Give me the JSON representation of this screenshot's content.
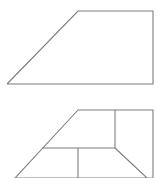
{
  "canvas": {
    "width": 158,
    "height": 178,
    "background_color": "#ffffff",
    "stroke_color": "#7d7d7d",
    "stroke_width": 1.1
  },
  "figures": [
    {
      "id": "figure-top",
      "name": "right-trapezoid",
      "description": "Right trapezoid with slanted left side, horizontal top and bottom, vertical right side",
      "outline_points": "7,84 78,11 153,11 153,84 7,84",
      "vertices": [
        {
          "name": "bottom-left-vertex",
          "x": 7,
          "y": 84
        },
        {
          "name": "top-left-vertex",
          "x": 78,
          "y": 11
        },
        {
          "name": "top-right-vertex",
          "x": 153,
          "y": 11
        },
        {
          "name": "bottom-right-vertex",
          "x": 153,
          "y": 84
        }
      ],
      "edges": [
        {
          "name": "left-slant-edge",
          "from": "7,84",
          "to": "78,11"
        },
        {
          "name": "top-edge",
          "from": "78,11",
          "to": "153,11"
        },
        {
          "name": "right-vertical-edge",
          "from": "153,11",
          "to": "153,84"
        },
        {
          "name": "bottom-edge",
          "from": "153,84",
          "to": "7,84"
        }
      ],
      "interior_segments": []
    },
    {
      "id": "figure-bottom",
      "name": "subdivided-trapezoid",
      "description": "Trapezoid cropped by image bottom edge, subdivided by interior horizontal and vertical segments",
      "outline_points": "78,110 153,110 153,178 15,178 78,110",
      "vertices": [
        {
          "name": "top-left-vertex",
          "x": 78,
          "y": 110
        },
        {
          "name": "top-right-vertex",
          "x": 153,
          "y": 110
        },
        {
          "name": "bottom-right-clipped-vertex",
          "x": 153,
          "y": 178
        },
        {
          "name": "bottom-left-clipped-vertex",
          "x": 15,
          "y": 178
        }
      ],
      "edges": [
        {
          "name": "left-slant-edge",
          "from": "78,110",
          "to": "15,178"
        },
        {
          "name": "top-edge",
          "from": "78,110",
          "to": "153,110"
        },
        {
          "name": "right-vertical-edge",
          "from": "153,110",
          "to": "153,178"
        }
      ],
      "interior_segments": [
        {
          "name": "interior-vertical-upper",
          "x1": 115,
          "y1": 110,
          "x2": 115,
          "y2": 148
        },
        {
          "name": "interior-horizontal-middle",
          "x1": 42,
          "y1": 148,
          "x2": 115,
          "y2": 148
        },
        {
          "name": "interior-diagonal-right",
          "x1": 115,
          "y1": 148,
          "x2": 147,
          "y2": 178
        },
        {
          "name": "interior-vertical-lower",
          "x1": 78,
          "y1": 148,
          "x2": 78,
          "y2": 178
        }
      ]
    }
  ]
}
